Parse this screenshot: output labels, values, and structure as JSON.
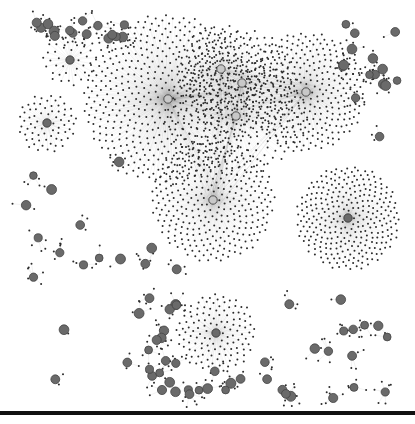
{
  "figure": {
    "type": "network-graph",
    "caption_fragment": "",
    "colors": {
      "background": "#ffffff",
      "leaf_node": "#2b2b2b",
      "hub_light": "#c8c8c8",
      "hub_dark": "#6a6a6a",
      "edge": "#9a9a9a",
      "rule": "#111111"
    },
    "clusters": [
      {
        "name": "central-left-hub",
        "hub_shade": "light",
        "leaves": 520,
        "density": "very-high"
      },
      {
        "name": "central-top-hub-a",
        "hub_shade": "light",
        "leaves": 120,
        "density": "high"
      },
      {
        "name": "central-top-hub-b",
        "hub_shade": "light",
        "leaves": 180,
        "density": "high"
      },
      {
        "name": "central-right-hub",
        "hub_shade": "light",
        "leaves": 320,
        "density": "very-high"
      },
      {
        "name": "central-lower-hub",
        "hub_shade": "light",
        "leaves": 200,
        "density": "high"
      },
      {
        "name": "middle-hub",
        "hub_shade": "light",
        "leaves": 330,
        "density": "high"
      },
      {
        "name": "right-hub",
        "hub_shade": "dark",
        "leaves": 300,
        "density": "high"
      },
      {
        "name": "bottom-center-hub",
        "hub_shade": "dark",
        "leaves": 130,
        "density": "medium"
      },
      {
        "name": "top-left-hub",
        "hub_shade": "dark",
        "leaves": 40,
        "density": "low"
      },
      {
        "name": "left-hub",
        "hub_shade": "dark",
        "leaves": 70,
        "density": "medium"
      }
    ],
    "small_components": 90
  }
}
